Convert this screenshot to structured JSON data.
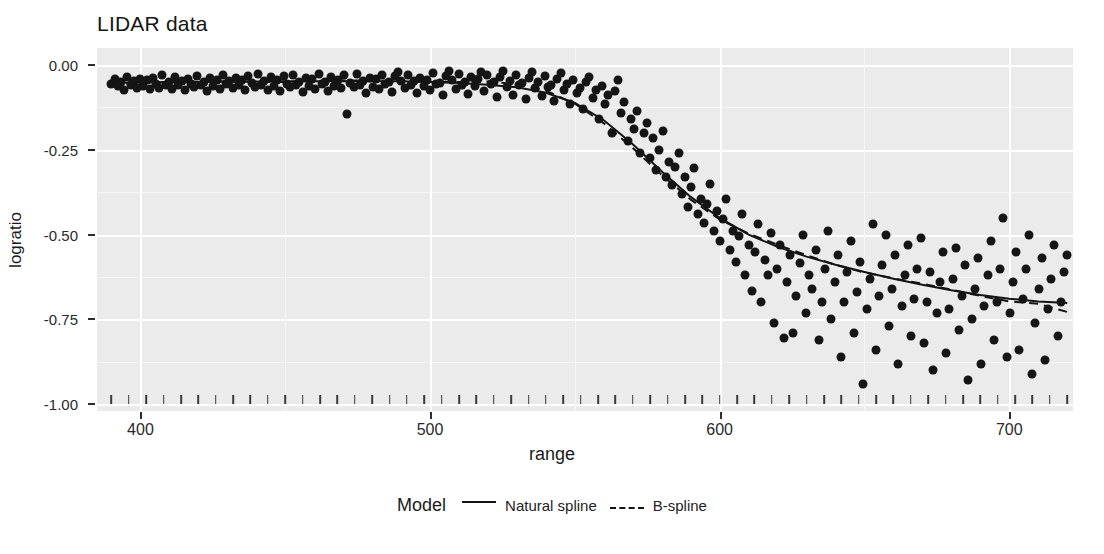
{
  "chart_data": {
    "type": "scatter",
    "title": "LIDAR data",
    "xlabel": "range",
    "ylabel": "logratio",
    "xlim": [
      385,
      722
    ],
    "ylim": [
      -1.02,
      0.05
    ],
    "grid": true,
    "legend_position": "bottom",
    "legend_title": "Model",
    "xticks": [
      400,
      500,
      600,
      700
    ],
    "xtick_labels": [
      "400",
      "500",
      "600",
      "700"
    ],
    "yticks": [
      0.0,
      -0.25,
      -0.5,
      -0.75,
      -1.0
    ],
    "ytick_labels": [
      "0.00",
      "-0.25",
      "-0.50",
      "-0.75",
      "-1.00"
    ],
    "panel_background": "#ebebeb",
    "gridline_color": "#ffffff",
    "point_color": "#151515",
    "line_color": "#141414",
    "series": [
      {
        "name": "Natural spline",
        "style": "solid",
        "x": [
          390,
          400,
          410,
          420,
          430,
          440,
          450,
          460,
          470,
          480,
          490,
          500,
          510,
          520,
          530,
          540,
          550,
          560,
          570,
          580,
          590,
          600,
          610,
          620,
          630,
          640,
          650,
          660,
          670,
          680,
          690,
          700,
          710,
          720
        ],
        "y": [
          -0.053,
          -0.052,
          -0.051,
          -0.05,
          -0.049,
          -0.049,
          -0.048,
          -0.048,
          -0.048,
          -0.048,
          -0.048,
          -0.05,
          -0.053,
          -0.058,
          -0.066,
          -0.082,
          -0.112,
          -0.163,
          -0.234,
          -0.314,
          -0.389,
          -0.451,
          -0.5,
          -0.536,
          -0.565,
          -0.589,
          -0.61,
          -0.63,
          -0.648,
          -0.664,
          -0.678,
          -0.689,
          -0.697,
          -0.702
        ]
      },
      {
        "name": "B-spline",
        "style": "dashed",
        "x": [
          390,
          400,
          410,
          420,
          430,
          440,
          450,
          460,
          470,
          480,
          490,
          500,
          510,
          520,
          530,
          540,
          550,
          560,
          570,
          580,
          590,
          600,
          610,
          620,
          630,
          640,
          650,
          660,
          670,
          680,
          690,
          700,
          710,
          720
        ],
        "y": [
          -0.056,
          -0.053,
          -0.05,
          -0.049,
          -0.049,
          -0.05,
          -0.05,
          -0.048,
          -0.046,
          -0.046,
          -0.048,
          -0.05,
          -0.05,
          -0.049,
          -0.056,
          -0.076,
          -0.114,
          -0.172,
          -0.245,
          -0.324,
          -0.397,
          -0.455,
          -0.497,
          -0.53,
          -0.561,
          -0.589,
          -0.612,
          -0.629,
          -0.645,
          -0.662,
          -0.681,
          -0.697,
          -0.704,
          -0.728
        ]
      }
    ],
    "points": [
      [
        390.0,
        -0.055
      ],
      [
        391.1,
        -0.041
      ],
      [
        392.2,
        -0.063
      ],
      [
        393.3,
        -0.05
      ],
      [
        394.4,
        -0.073
      ],
      [
        395.5,
        -0.036
      ],
      [
        396.6,
        -0.059
      ],
      [
        397.7,
        -0.048
      ],
      [
        398.8,
        -0.068
      ],
      [
        399.9,
        -0.04
      ],
      [
        401.0,
        -0.062
      ],
      [
        402.1,
        -0.045
      ],
      [
        403.2,
        -0.07
      ],
      [
        404.3,
        -0.038
      ],
      [
        405.4,
        -0.056
      ],
      [
        406.5,
        -0.067
      ],
      [
        407.6,
        -0.031
      ],
      [
        408.7,
        -0.059
      ],
      [
        409.8,
        -0.049
      ],
      [
        410.9,
        -0.072
      ],
      [
        412.0,
        -0.035
      ],
      [
        413.1,
        -0.06
      ],
      [
        414.2,
        -0.046
      ],
      [
        415.3,
        -0.074
      ],
      [
        416.4,
        -0.04
      ],
      [
        417.5,
        -0.055
      ],
      [
        418.6,
        -0.065
      ],
      [
        419.7,
        -0.033
      ],
      [
        420.8,
        -0.058
      ],
      [
        421.9,
        -0.05
      ],
      [
        423.0,
        -0.077
      ],
      [
        424.1,
        -0.037
      ],
      [
        425.2,
        -0.062
      ],
      [
        426.3,
        -0.045
      ],
      [
        427.4,
        -0.07
      ],
      [
        428.5,
        -0.029
      ],
      [
        429.6,
        -0.057
      ],
      [
        430.7,
        -0.048
      ],
      [
        431.8,
        -0.069
      ],
      [
        432.9,
        -0.038
      ],
      [
        434.0,
        -0.06
      ],
      [
        435.1,
        -0.043
      ],
      [
        436.2,
        -0.075
      ],
      [
        437.3,
        -0.034
      ],
      [
        438.4,
        -0.054
      ],
      [
        439.5,
        -0.066
      ],
      [
        440.6,
        -0.028
      ],
      [
        441.7,
        -0.059
      ],
      [
        442.8,
        -0.047
      ],
      [
        443.9,
        -0.073
      ],
      [
        445.0,
        -0.036
      ],
      [
        446.1,
        -0.061
      ],
      [
        447.2,
        -0.044
      ],
      [
        448.3,
        -0.078
      ],
      [
        449.4,
        -0.032
      ],
      [
        450.5,
        -0.056
      ],
      [
        451.6,
        -0.064
      ],
      [
        452.7,
        -0.03
      ],
      [
        453.8,
        -0.058
      ],
      [
        454.9,
        -0.049
      ],
      [
        456.0,
        -0.08
      ],
      [
        457.1,
        -0.039
      ],
      [
        458.2,
        -0.063
      ],
      [
        459.3,
        -0.042
      ],
      [
        460.4,
        -0.071
      ],
      [
        461.5,
        -0.027
      ],
      [
        462.6,
        -0.057
      ],
      [
        463.7,
        -0.05
      ],
      [
        464.8,
        -0.076
      ],
      [
        465.9,
        -0.035
      ],
      [
        467.0,
        -0.062
      ],
      [
        468.1,
        -0.044
      ],
      [
        469.2,
        -0.068
      ],
      [
        470.3,
        -0.031
      ],
      [
        471.4,
        -0.144
      ],
      [
        472.5,
        -0.053
      ],
      [
        473.6,
        -0.065
      ],
      [
        474.7,
        -0.026
      ],
      [
        475.8,
        -0.06
      ],
      [
        476.9,
        -0.047
      ],
      [
        478.0,
        -0.082
      ],
      [
        479.1,
        -0.038
      ],
      [
        480.2,
        -0.064
      ],
      [
        481.3,
        -0.041
      ],
      [
        482.4,
        -0.072
      ],
      [
        483.5,
        -0.029
      ],
      [
        484.6,
        -0.055
      ],
      [
        485.7,
        -0.051
      ],
      [
        486.8,
        -0.079
      ],
      [
        487.9,
        -0.034
      ],
      [
        489.0,
        -0.02
      ],
      [
        490.1,
        -0.046
      ],
      [
        491.2,
        -0.067
      ],
      [
        492.3,
        -0.03
      ],
      [
        493.4,
        -0.059
      ],
      [
        494.5,
        -0.048
      ],
      [
        495.6,
        -0.084
      ],
      [
        496.7,
        -0.037
      ],
      [
        497.8,
        -0.063
      ],
      [
        498.9,
        -0.043
      ],
      [
        500.0,
        -0.074
      ],
      [
        501.1,
        -0.025
      ],
      [
        502.2,
        -0.056
      ],
      [
        503.3,
        -0.052
      ],
      [
        504.4,
        -0.09
      ],
      [
        505.5,
        -0.033
      ],
      [
        506.6,
        -0.018
      ],
      [
        507.7,
        -0.045
      ],
      [
        508.8,
        -0.07
      ],
      [
        509.9,
        -0.028
      ],
      [
        511.0,
        -0.058
      ],
      [
        512.1,
        -0.049
      ],
      [
        513.2,
        -0.086
      ],
      [
        514.3,
        -0.036
      ],
      [
        515.4,
        -0.062
      ],
      [
        516.5,
        -0.042
      ],
      [
        517.6,
        -0.022
      ],
      [
        518.7,
        -0.076
      ],
      [
        519.8,
        -0.031
      ],
      [
        520.9,
        -0.057
      ],
      [
        522.0,
        -0.051
      ],
      [
        523.1,
        -0.095
      ],
      [
        524.2,
        -0.035
      ],
      [
        525.3,
        -0.019
      ],
      [
        526.4,
        -0.066
      ],
      [
        527.5,
        -0.047
      ],
      [
        528.6,
        -0.088
      ],
      [
        529.7,
        -0.03
      ],
      [
        530.8,
        -0.06
      ],
      [
        531.9,
        -0.054
      ],
      [
        533.0,
        -0.1
      ],
      [
        534.1,
        -0.039
      ],
      [
        535.2,
        -0.021
      ],
      [
        536.3,
        -0.069
      ],
      [
        537.4,
        -0.05
      ],
      [
        538.5,
        -0.092
      ],
      [
        539.6,
        -0.033
      ],
      [
        540.7,
        -0.064
      ],
      [
        541.8,
        -0.058
      ],
      [
        542.9,
        -0.107
      ],
      [
        544.0,
        -0.042
      ],
      [
        545.1,
        -0.025
      ],
      [
        546.2,
        -0.075
      ],
      [
        547.3,
        -0.055
      ],
      [
        548.4,
        -0.115
      ],
      [
        549.5,
        -0.045
      ],
      [
        550.6,
        -0.082
      ],
      [
        551.7,
        -0.068
      ],
      [
        552.8,
        -0.13
      ],
      [
        553.9,
        -0.05
      ],
      [
        555.0,
        -0.035
      ],
      [
        556.1,
        -0.098
      ],
      [
        557.2,
        -0.074
      ],
      [
        558.3,
        -0.158
      ],
      [
        559.4,
        -0.062
      ],
      [
        560.5,
        -0.115
      ],
      [
        561.6,
        -0.09
      ],
      [
        562.7,
        -0.2
      ],
      [
        563.8,
        -0.078
      ],
      [
        564.9,
        -0.045
      ],
      [
        566.0,
        -0.142
      ],
      [
        567.1,
        -0.108
      ],
      [
        568.2,
        -0.225
      ],
      [
        569.3,
        -0.16
      ],
      [
        570.4,
        -0.19
      ],
      [
        571.5,
        -0.135
      ],
      [
        572.6,
        -0.26
      ],
      [
        573.7,
        -0.2
      ],
      [
        574.8,
        -0.17
      ],
      [
        575.9,
        -0.275
      ],
      [
        577.0,
        -0.215
      ],
      [
        578.1,
        -0.31
      ],
      [
        579.2,
        -0.25
      ],
      [
        580.3,
        -0.195
      ],
      [
        581.4,
        -0.33
      ],
      [
        582.5,
        -0.285
      ],
      [
        583.6,
        -0.355
      ],
      [
        584.7,
        -0.3
      ],
      [
        585.8,
        -0.26
      ],
      [
        586.9,
        -0.38
      ],
      [
        588.0,
        -0.33
      ],
      [
        589.1,
        -0.42
      ],
      [
        590.2,
        -0.36
      ],
      [
        591.3,
        -0.305
      ],
      [
        592.4,
        -0.44
      ],
      [
        593.5,
        -0.395
      ],
      [
        594.6,
        -0.465
      ],
      [
        595.7,
        -0.41
      ],
      [
        596.8,
        -0.35
      ],
      [
        597.9,
        -0.49
      ],
      [
        599.0,
        -0.43
      ],
      [
        600.1,
        -0.52
      ],
      [
        601.2,
        -0.455
      ],
      [
        602.3,
        -0.395
      ],
      [
        603.4,
        -0.545
      ],
      [
        604.5,
        -0.49
      ],
      [
        605.6,
        -0.58
      ],
      [
        606.7,
        -0.505
      ],
      [
        607.8,
        -0.44
      ],
      [
        608.9,
        -0.62
      ],
      [
        610.0,
        -0.53
      ],
      [
        611.1,
        -0.665
      ],
      [
        612.2,
        -0.55
      ],
      [
        613.3,
        -0.47
      ],
      [
        614.4,
        -0.7
      ],
      [
        615.5,
        -0.575
      ],
      [
        616.6,
        -0.62
      ],
      [
        617.7,
        -0.495
      ],
      [
        618.8,
        -0.76
      ],
      [
        619.9,
        -0.6
      ],
      [
        621.0,
        -0.53
      ],
      [
        622.1,
        -0.805
      ],
      [
        623.2,
        -0.64
      ],
      [
        624.3,
        -0.56
      ],
      [
        625.4,
        -0.79
      ],
      [
        626.5,
        -0.68
      ],
      [
        627.6,
        -0.585
      ],
      [
        628.7,
        -0.5
      ],
      [
        629.8,
        -0.73
      ],
      [
        630.9,
        -0.62
      ],
      [
        632.0,
        -0.66
      ],
      [
        633.1,
        -0.545
      ],
      [
        634.2,
        -0.81
      ],
      [
        635.3,
        -0.7
      ],
      [
        636.4,
        -0.6
      ],
      [
        637.5,
        -0.49
      ],
      [
        638.6,
        -0.75
      ],
      [
        639.7,
        -0.64
      ],
      [
        640.8,
        -0.56
      ],
      [
        641.9,
        -0.86
      ],
      [
        643.0,
        -0.7
      ],
      [
        644.1,
        -0.61
      ],
      [
        645.2,
        -0.52
      ],
      [
        646.3,
        -0.79
      ],
      [
        647.4,
        -0.67
      ],
      [
        648.5,
        -0.58
      ],
      [
        649.6,
        -0.94
      ],
      [
        650.7,
        -0.72
      ],
      [
        651.8,
        -0.63
      ],
      [
        652.9,
        -0.47
      ],
      [
        654.0,
        -0.84
      ],
      [
        655.1,
        -0.68
      ],
      [
        656.2,
        -0.59
      ],
      [
        657.3,
        -0.5
      ],
      [
        658.4,
        -0.77
      ],
      [
        659.5,
        -0.66
      ],
      [
        660.6,
        -0.56
      ],
      [
        661.7,
        -0.88
      ],
      [
        662.8,
        -0.71
      ],
      [
        663.9,
        -0.62
      ],
      [
        665.0,
        -0.53
      ],
      [
        666.1,
        -0.8
      ],
      [
        667.2,
        -0.69
      ],
      [
        668.3,
        -0.6
      ],
      [
        669.4,
        -0.51
      ],
      [
        670.5,
        -0.82
      ],
      [
        671.6,
        -0.7
      ],
      [
        672.7,
        -0.61
      ],
      [
        673.8,
        -0.9
      ],
      [
        674.9,
        -0.73
      ],
      [
        676.0,
        -0.64
      ],
      [
        677.1,
        -0.55
      ],
      [
        678.2,
        -0.85
      ],
      [
        679.3,
        -0.72
      ],
      [
        680.4,
        -0.63
      ],
      [
        681.5,
        -0.54
      ],
      [
        682.6,
        -0.78
      ],
      [
        683.7,
        -0.68
      ],
      [
        684.8,
        -0.59
      ],
      [
        685.9,
        -0.93
      ],
      [
        687.0,
        -0.75
      ],
      [
        688.1,
        -0.66
      ],
      [
        689.2,
        -0.57
      ],
      [
        690.3,
        -0.88
      ],
      [
        691.4,
        -0.71
      ],
      [
        692.5,
        -0.62
      ],
      [
        693.6,
        -0.52
      ],
      [
        694.7,
        -0.81
      ],
      [
        695.8,
        -0.7
      ],
      [
        696.9,
        -0.6
      ],
      [
        698.0,
        -0.45
      ],
      [
        699.1,
        -0.86
      ],
      [
        700.2,
        -0.73
      ],
      [
        701.3,
        -0.64
      ],
      [
        702.4,
        -0.55
      ],
      [
        703.5,
        -0.84
      ],
      [
        704.6,
        -0.69
      ],
      [
        705.7,
        -0.6
      ],
      [
        706.8,
        -0.5
      ],
      [
        707.9,
        -0.91
      ],
      [
        709.0,
        -0.76
      ],
      [
        710.1,
        -0.66
      ],
      [
        711.2,
        -0.57
      ],
      [
        712.3,
        -0.87
      ],
      [
        713.4,
        -0.72
      ],
      [
        714.5,
        -0.63
      ],
      [
        715.6,
        -0.53
      ],
      [
        716.7,
        -0.8
      ],
      [
        717.8,
        -0.7
      ],
      [
        718.9,
        -0.61
      ],
      [
        720.0,
        -0.56
      ]
    ],
    "rug_x": [
      390,
      396,
      402,
      408,
      414,
      420,
      426,
      432,
      438,
      444,
      450,
      456,
      462,
      468,
      474,
      480,
      486,
      492,
      498,
      504,
      510,
      516,
      522,
      528,
      534,
      540,
      546,
      552,
      558,
      564,
      570,
      576,
      582,
      588,
      594,
      600,
      606,
      612,
      618,
      624,
      630,
      636,
      642,
      648,
      654,
      660,
      666,
      672,
      678,
      684,
      690,
      696,
      702,
      708,
      714,
      720
    ]
  }
}
